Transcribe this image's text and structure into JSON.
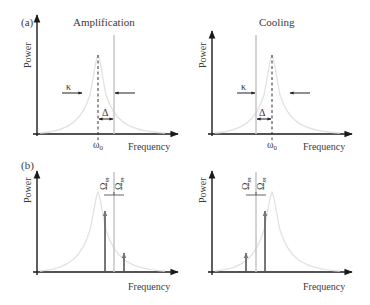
{
  "panel_a": {
    "label": "(a)",
    "left": {
      "title": "Amplification",
      "y_label": "Power",
      "x_label": "Frequency",
      "resonance_label": "ω",
      "resonance_sub": "0",
      "linewidth_label": "κ",
      "detuning_label": "Δ"
    },
    "right": {
      "title": "Cooling",
      "y_label": "Power",
      "x_label": "Frequency",
      "resonance_label": "ω",
      "resonance_sub": "0",
      "linewidth_label": "κ",
      "detuning_label": "Δ"
    }
  },
  "panel_b": {
    "label": "(b)",
    "left": {
      "y_label": "Power",
      "x_label": "Frequency",
      "sideband_label": "Ω",
      "sideband_sub": "m"
    },
    "right": {
      "y_label": "Power",
      "x_label": "Frequency",
      "sideband_label": "Ω",
      "sideband_sub": "m"
    }
  },
  "colors": {
    "axis": "#1a1a1a",
    "cavity_lorentzian": "#e2e2e2",
    "laser_line": "#c8c8c8",
    "text": "#3a3a3a"
  }
}
